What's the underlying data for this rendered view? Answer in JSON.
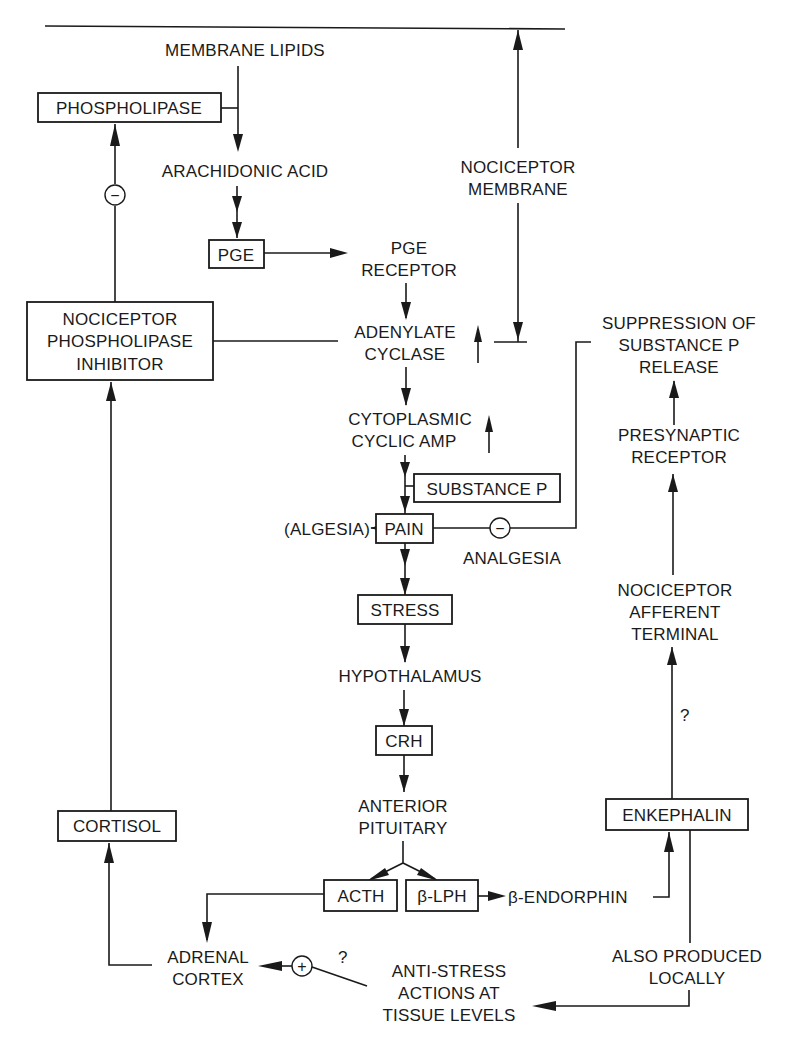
{
  "diagram": {
    "colors": {
      "ink": "#1a1a1a",
      "background": "#ffffff"
    },
    "nodes": {
      "membrane_lipids": "MEMBRANE LIPIDS",
      "phospholipase": "PHOSPHOLIPASE",
      "arachidonic_acid": "ARACHIDONIC ACID",
      "pge": "PGE",
      "pge_receptor": [
        "PGE",
        "RECEPTOR"
      ],
      "nociceptor_membrane": [
        "NOCICEPTOR",
        "MEMBRANE"
      ],
      "nociceptor_phospholipase_inhibitor": [
        "NOCICEPTOR",
        "PHOSPHOLIPASE",
        "INHIBITOR"
      ],
      "adenylate_cyclase": [
        "ADENYLATE",
        "CYCLASE"
      ],
      "suppression_substance_p": [
        "SUPPRESSION OF",
        "SUBSTANCE P",
        "RELEASE"
      ],
      "cytoplasmic_camp": [
        "CYTOPLASMIC",
        "CYCLIC AMP"
      ],
      "substance_p": "SUBSTANCE P",
      "algesia_label": "(ALGESIA)",
      "pain": "PAIN",
      "analgesia": "ANALGESIA",
      "presynaptic_receptor": [
        "PRESYNAPTIC",
        "RECEPTOR"
      ],
      "stress": "STRESS",
      "nociceptor_afferent_terminal": [
        "NOCICEPTOR",
        "AFFERENT",
        "TERMINAL"
      ],
      "hypothalamus": "HYPOTHALAMUS",
      "crh": "CRH",
      "anterior_pituitary": [
        "ANTERIOR",
        "PITUITARY"
      ],
      "cortisol": "CORTISOL",
      "enkephalin": "ENKEPHALIN",
      "acth": "ACTH",
      "beta_lph": "β-LPH",
      "beta_endorphin": "β-ENDORPHIN",
      "adrenal_cortex": [
        "ADRENAL",
        "CORTEX"
      ],
      "anti_stress": [
        "ANTI-STRESS",
        "ACTIONS AT",
        "TISSUE LEVELS"
      ],
      "also_produced_locally": [
        "ALSO PRODUCED",
        "LOCALLY"
      ]
    },
    "symbols": {
      "minus": "−",
      "plus": "+",
      "question": "?",
      "up_arrow_hint": "increase"
    }
  }
}
